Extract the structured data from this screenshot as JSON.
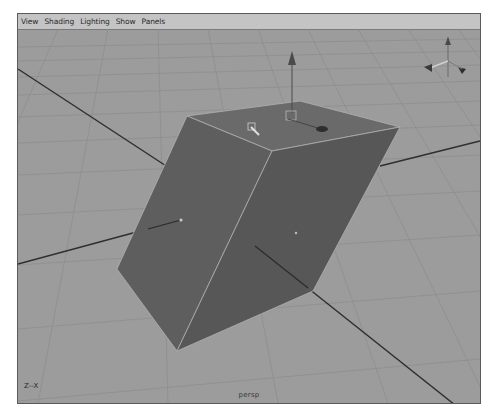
{
  "menubar": {
    "items": [
      "View",
      "Shading",
      "Lighting",
      "Show",
      "Panels"
    ]
  },
  "viewport": {
    "camera_label": "persp",
    "axis_indicator": "Z--X",
    "object": "cube",
    "manipulator": "move-tool",
    "colors": {
      "background": "#9c9c9c",
      "grid": "#8a8a8a",
      "cube_front": "#5f5f5f",
      "cube_right": "#565656",
      "cube_top": "#6b6b6b",
      "edge_highlight": "#b8b8b8",
      "axis_line": "#2e2e2e"
    }
  }
}
